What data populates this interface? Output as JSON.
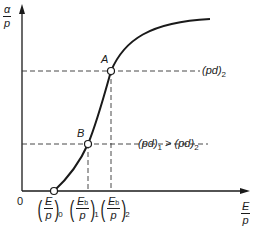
{
  "diagram": {
    "y_axis": {
      "label_num": "α",
      "label_den": "p"
    },
    "x_axis": {
      "label_num": "E",
      "label_den": "p"
    },
    "origin_label": "0",
    "points": {
      "A": {
        "label": "A",
        "line_label": "(pd)",
        "line_label_sub": "2"
      },
      "B": {
        "label": "B",
        "line_label": "(pd)",
        "line_label_sub": "1",
        "relation": " > ",
        "compare": "(pd)",
        "compare_sub": "2"
      }
    },
    "x_ticks": [
      {
        "num": "E",
        "num_sub": "",
        "den": "p",
        "sub": "0"
      },
      {
        "num": "E",
        "num_sub": "b",
        "den": "p",
        "sub": "1"
      },
      {
        "num": "E",
        "num_sub": "b",
        "den": "p",
        "sub": "2"
      }
    ],
    "colors": {
      "ink": "#1a1a1a",
      "dash": "#333333",
      "marker_fill": "#ffffff"
    }
  }
}
